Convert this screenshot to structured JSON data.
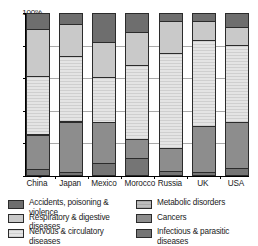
{
  "chart_data": {
    "type": "bar",
    "subtype": "100% stacked bar",
    "title": "",
    "xlabel": "",
    "ylabel": "",
    "ylim": [
      0,
      100
    ],
    "ytick_labels": [
      "0",
      "20%",
      "40%",
      "60%",
      "80%",
      "100%"
    ],
    "ytick_values": [
      0,
      20,
      40,
      60,
      80,
      100
    ],
    "grid": true,
    "legend_position": "bottom",
    "stack_order_bottom_to_top": [
      "Infectious & parasitic diseases",
      "Cancers",
      "Metabolic disorders",
      "Nervous & circulatory diseases",
      "Respiratory & digestive diseases",
      "Accidents, poisoning & violence"
    ],
    "categories": [
      "China",
      "Japan",
      "Mexico",
      "Morocco",
      "Russia",
      "UK",
      "USA"
    ],
    "series": [
      {
        "name": "Infectious & parasitic diseases",
        "values": [
          3,
          1,
          7,
          10,
          2,
          1,
          4
        ]
      },
      {
        "name": "Cancers",
        "values": [
          21,
          31,
          25,
          12,
          14,
          29,
          28
        ]
      },
      {
        "name": "Metabolic disorders",
        "values": [
          1,
          1,
          0,
          0,
          0,
          0,
          0
        ]
      },
      {
        "name": "Nervous & circulatory diseases",
        "values": [
          36,
          40,
          28,
          46,
          59,
          53,
          48
        ]
      },
      {
        "name": "Respiratory & digestive diseases",
        "values": [
          29,
          20,
          22,
          20,
          20,
          12,
          11
        ]
      },
      {
        "name": "Accidents, poisoning & violence",
        "values": [
          10,
          7,
          18,
          12,
          5,
          5,
          9
        ]
      }
    ]
  },
  "axis": {
    "ticks": [
      {
        "label": "100%",
        "value": 100
      },
      {
        "label": "80%",
        "value": 80
      },
      {
        "label": "60%",
        "value": 60
      },
      {
        "label": "40%",
        "value": 40
      },
      {
        "label": "20%",
        "value": 20
      },
      {
        "label": "0",
        "value": 0
      }
    ]
  },
  "bars": [
    {
      "country": "China",
      "segments": [
        {
          "key": "infectious",
          "label": "Infectious & parasitic diseases",
          "value": 3
        },
        {
          "key": "cancers",
          "label": "Cancers",
          "value": 21
        },
        {
          "key": "metabolic",
          "label": "Metabolic disorders",
          "value": 1
        },
        {
          "key": "nervous",
          "label": "Nervous & circulatory diseases",
          "value": 36
        },
        {
          "key": "respiratory",
          "label": "Respiratory & digestive diseases",
          "value": 29
        },
        {
          "key": "accidents",
          "label": "Accidents, poisoning & violence",
          "value": 10
        }
      ]
    },
    {
      "country": "Japan",
      "segments": [
        {
          "key": "infectious",
          "label": "Infectious & parasitic diseases",
          "value": 1
        },
        {
          "key": "cancers",
          "label": "Cancers",
          "value": 31
        },
        {
          "key": "metabolic",
          "label": "Metabolic disorders",
          "value": 1
        },
        {
          "key": "nervous",
          "label": "Nervous & circulatory diseases",
          "value": 40
        },
        {
          "key": "respiratory",
          "label": "Respiratory & digestive diseases",
          "value": 20
        },
        {
          "key": "accidents",
          "label": "Accidents, poisoning & violence",
          "value": 7
        }
      ]
    },
    {
      "country": "Mexico",
      "segments": [
        {
          "key": "infectious",
          "label": "Infectious & parasitic diseases",
          "value": 7
        },
        {
          "key": "cancers",
          "label": "Cancers",
          "value": 25
        },
        {
          "key": "nervous",
          "label": "Nervous & circulatory diseases",
          "value": 28
        },
        {
          "key": "respiratory",
          "label": "Respiratory & digestive diseases",
          "value": 22
        },
        {
          "key": "accidents",
          "label": "Accidents, poisoning & violence",
          "value": 18
        }
      ]
    },
    {
      "country": "Morocco",
      "segments": [
        {
          "key": "infectious",
          "label": "Infectious & parasitic diseases",
          "value": 10
        },
        {
          "key": "cancers",
          "label": "Cancers",
          "value": 12
        },
        {
          "key": "nervous",
          "label": "Nervous & circulatory diseases",
          "value": 46
        },
        {
          "key": "respiratory",
          "label": "Respiratory & digestive diseases",
          "value": 20
        },
        {
          "key": "accidents",
          "label": "Accidents, poisoning & violence",
          "value": 12
        }
      ]
    },
    {
      "country": "Russia",
      "segments": [
        {
          "key": "infectious",
          "label": "Infectious & parasitic diseases",
          "value": 2
        },
        {
          "key": "cancers",
          "label": "Cancers",
          "value": 14
        },
        {
          "key": "nervous",
          "label": "Nervous & circulatory diseases",
          "value": 59
        },
        {
          "key": "respiratory",
          "label": "Respiratory & digestive diseases",
          "value": 20
        },
        {
          "key": "accidents",
          "label": "Accidents, poisoning & violence",
          "value": 5
        }
      ]
    },
    {
      "country": "UK",
      "segments": [
        {
          "key": "infectious",
          "label": "Infectious & parasitic diseases",
          "value": 1
        },
        {
          "key": "cancers",
          "label": "Cancers",
          "value": 29
        },
        {
          "key": "nervous",
          "label": "Nervous & circulatory diseases",
          "value": 53
        },
        {
          "key": "respiratory",
          "label": "Respiratory & digestive diseases",
          "value": 12
        },
        {
          "key": "accidents",
          "label": "Accidents, poisoning & violence",
          "value": 5
        }
      ]
    },
    {
      "country": "USA",
      "segments": [
        {
          "key": "infectious",
          "label": "Infectious & parasitic diseases",
          "value": 4
        },
        {
          "key": "cancers",
          "label": "Cancers",
          "value": 28
        },
        {
          "key": "nervous",
          "label": "Nervous & circulatory diseases",
          "value": 48
        },
        {
          "key": "respiratory",
          "label": "Respiratory & digestive diseases",
          "value": 11
        },
        {
          "key": "accidents",
          "label": "Accidents, poisoning & violence",
          "value": 9
        }
      ]
    }
  ],
  "legend": {
    "items": [
      {
        "key": "accidents",
        "label": "Accidents, poisoning & violence",
        "color": "#6e6e6e",
        "column": "left"
      },
      {
        "key": "respiratory",
        "label": "Respiratory & digestive diseases",
        "color": "#c9c9c9",
        "column": "left"
      },
      {
        "key": "nervous",
        "label": "Nervous & circulatory diseases",
        "color": "#dcdcdc",
        "column": "left"
      },
      {
        "key": "metabolic",
        "label": "Metabolic disorders",
        "color": "#b5b5b5",
        "column": "right"
      },
      {
        "key": "cancers",
        "label": "Cancers",
        "color": "#8d8d8d",
        "column": "right"
      },
      {
        "key": "infectious",
        "label": "Infectious & parasitic\ndiseases",
        "color": "#757575",
        "column": "right"
      }
    ]
  }
}
